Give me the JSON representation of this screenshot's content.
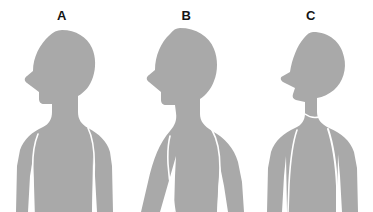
{
  "image": {
    "kind": "anatomical-posture-diagram",
    "subject": "head and neck posture comparison, lateral profile silhouettes",
    "background_color": "#ffffff",
    "silhouette_color": "#a9a9a9",
    "outline_color": "#ffffff",
    "label_color": "#151515",
    "width": 373,
    "height": 212
  },
  "panels": [
    {
      "id": "a",
      "label": "A",
      "posture": "neutral upright head and neck alignment",
      "head_tilt": "neutral",
      "facing": "left"
    },
    {
      "id": "b",
      "label": "B",
      "posture": "forward head posture with rounded upper back",
      "head_tilt": "forward",
      "facing": "left"
    },
    {
      "id": "c",
      "label": "C",
      "posture": "cervical extension, chin lifted and head tilted back",
      "head_tilt": "extended",
      "facing": "left"
    }
  ]
}
